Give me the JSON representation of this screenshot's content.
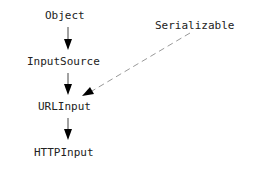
{
  "diagram": {
    "nodes": [
      {
        "id": "object",
        "label": "Object"
      },
      {
        "id": "inputsource",
        "label": "InputSource"
      },
      {
        "id": "urlinput",
        "label": "URLInput"
      },
      {
        "id": "httpinput",
        "label": "HTTPInput"
      },
      {
        "id": "serializable",
        "label": "Serializable"
      }
    ],
    "edges": [
      {
        "from": "inputsource",
        "to": "object",
        "style": "solid"
      },
      {
        "from": "urlinput",
        "to": "inputsource",
        "style": "solid"
      },
      {
        "from": "httpinput",
        "to": "urlinput",
        "style": "solid"
      },
      {
        "from": "serializable",
        "to": "urlinput",
        "style": "dashed"
      }
    ]
  }
}
